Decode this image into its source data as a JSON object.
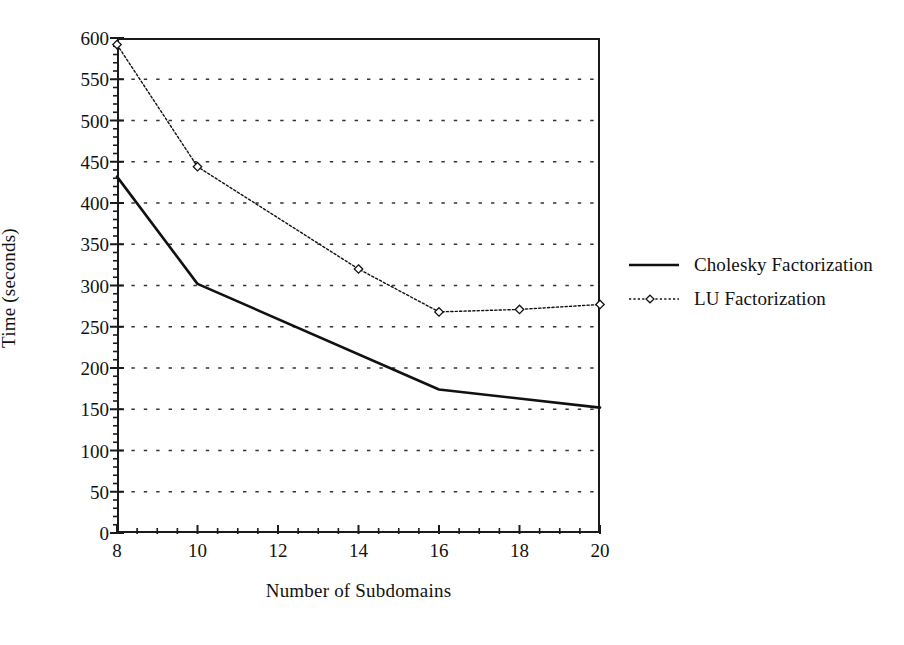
{
  "chart_data": {
    "type": "line",
    "title": "",
    "xlabel": "Number of Subdomains",
    "ylabel": "Time (seconds)",
    "xlim": [
      8,
      20
    ],
    "ylim": [
      0,
      600
    ],
    "xticks": [
      8,
      10,
      12,
      14,
      16,
      18,
      20
    ],
    "xtick_labels": [
      "8",
      "10",
      "12",
      "14",
      "16",
      "18",
      "20"
    ],
    "x_minor_tick_step": 0.5,
    "yticks": [
      0,
      50,
      100,
      150,
      200,
      250,
      300,
      350,
      400,
      450,
      500,
      550,
      600
    ],
    "ytick_labels": [
      "0",
      "50",
      "100",
      "150",
      "200",
      "250",
      "300",
      "350",
      "400",
      "450",
      "500",
      "550",
      "600"
    ],
    "y_minor_tick_step": 10,
    "grid": "horizontal-dotted",
    "legend_position": "right",
    "series": [
      {
        "name": "Cholesky Factorization",
        "line_style": "solid",
        "line_width": 2.6,
        "marker": "none",
        "color": "#111111",
        "x": [
          8,
          10,
          16,
          20
        ],
        "values": [
          432,
          302,
          174,
          152
        ]
      },
      {
        "name": "LU Factorization",
        "line_style": "dotted",
        "line_width": 1.4,
        "marker": "diamond",
        "color": "#111111",
        "x": [
          8,
          10,
          14,
          16,
          18,
          20
        ],
        "values": [
          592,
          444,
          320,
          268,
          271,
          277
        ]
      }
    ]
  },
  "legend": {
    "items": [
      {
        "label": "Cholesky Factorization",
        "style": "solid",
        "marker": "none"
      },
      {
        "label": "LU Factorization",
        "style": "dotted",
        "marker": "diamond"
      }
    ]
  },
  "colors": {
    "foreground": "#111111",
    "axis": "#1a1a1a",
    "grid": "#333333",
    "background": "#ffffff"
  }
}
